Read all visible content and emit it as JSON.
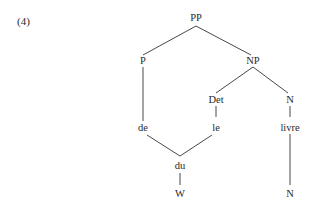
{
  "example": {
    "number": "(4)"
  },
  "tree": {
    "nodes": {
      "pp": {
        "label": "PP"
      },
      "p": {
        "label": "P"
      },
      "np": {
        "label": "NP"
      },
      "det": {
        "label": "Det"
      },
      "n_upper": {
        "label": "N"
      },
      "de": {
        "label": "de"
      },
      "le": {
        "label": "le"
      },
      "livre": {
        "label": "livre"
      },
      "du": {
        "label": "du"
      },
      "w": {
        "label": "W"
      },
      "n_lower": {
        "label": "N"
      }
    },
    "edges": [
      [
        "PP",
        "P"
      ],
      [
        "PP",
        "NP"
      ],
      [
        "NP",
        "Det"
      ],
      [
        "NP",
        "N"
      ],
      [
        "P",
        "de"
      ],
      [
        "Det",
        "le"
      ],
      [
        "N",
        "livre"
      ],
      [
        "de",
        "du"
      ],
      [
        "le",
        "du"
      ],
      [
        "du",
        "W"
      ],
      [
        "livre",
        "N"
      ]
    ]
  }
}
